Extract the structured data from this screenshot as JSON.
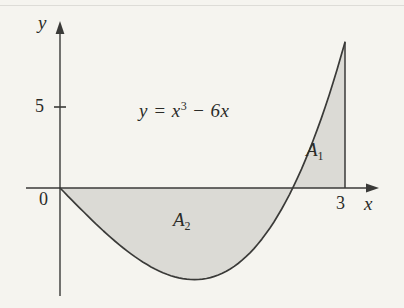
{
  "figure": {
    "background_color": "#f5f4ef",
    "line_color": "#3a3a38",
    "fill_color": "#dbdad5",
    "text_color": "#2b2b28",
    "labels": {
      "y_axis": "y",
      "x_axis": "x",
      "origin": "0",
      "y_tick": "5",
      "x_tick": "3",
      "equation_base1": "y = x",
      "equation_sup": "3",
      "equation_base2": " − 6x",
      "a1_letter": "A",
      "a1_sub": "1",
      "a2_letter": "A",
      "a2_sub": "2"
    }
  },
  "chart_data": {
    "type": "area",
    "function": "y = x^3 - 6x",
    "polynomial_coeffs": [
      1,
      0,
      -6,
      0
    ],
    "x_domain": [
      0,
      3
    ],
    "x_intercepts": [
      0,
      2.4495
    ],
    "x_axis_range": [
      -0.37,
      3.35
    ],
    "y_axis_range": [
      -6.7,
      10.3
    ],
    "x_ticks": [
      3
    ],
    "y_ticks": [
      5
    ],
    "grid": false,
    "legend": false,
    "regions": [
      {
        "label": "A1",
        "x_from": 2.4495,
        "x_to": 3,
        "side": "above x-axis",
        "bounded_right_by": "x = 3"
      },
      {
        "label": "A2",
        "x_from": 0,
        "x_to": 2.4495,
        "side": "below x-axis"
      }
    ],
    "key_points": {
      "local_min": {
        "x": 1.414,
        "y": -5.657
      },
      "right_endpoint": {
        "x": 3,
        "y": 9
      }
    }
  }
}
